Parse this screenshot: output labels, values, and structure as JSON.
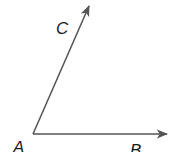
{
  "diagram": {
    "type": "angle",
    "line_color": "#555555",
    "label_color": "#1a1a1a",
    "points": {
      "A": {
        "label": "A",
        "x": 33,
        "y": 134
      },
      "B": {
        "label": "B",
        "x": 169,
        "y": 134
      },
      "C": {
        "label": "C",
        "x": 90,
        "y": 4
      }
    },
    "rays": [
      {
        "from": "A",
        "through": "C",
        "arrow": true
      },
      {
        "from": "A",
        "through": "B",
        "arrow": true
      }
    ],
    "labels": {
      "A": "A",
      "B": "B",
      "C": "C"
    }
  }
}
